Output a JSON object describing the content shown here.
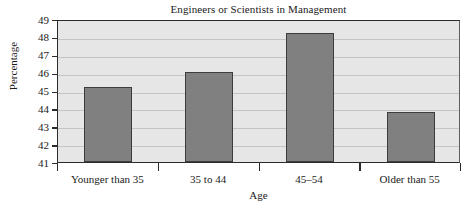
{
  "chart_data": {
    "type": "bar",
    "title": "Engineers or Scientists in Management",
    "xlabel": "Age",
    "ylabel": "Percentage",
    "categories": [
      "Younger than 35",
      "35 to 44",
      "45–54",
      "Older than 55"
    ],
    "values": [
      45.2,
      46.05,
      48.2,
      43.8
    ],
    "ylim": [
      41,
      49
    ],
    "yticks": [
      41,
      42,
      43,
      44,
      45,
      46,
      47,
      48,
      49
    ],
    "ytick_labels": [
      "41",
      "42",
      "43",
      "44",
      "45",
      "46",
      "47",
      "48",
      "49"
    ],
    "grid": true,
    "grid_axis": "y",
    "legend": false,
    "bar_color": "#808080",
    "bar_edge_color": "#3d3d3d",
    "plot_background": "#e6e6e6",
    "figure_background": "#ffffff",
    "gridline_color": "#c4c4c4",
    "axis_color": "#2b2b2b"
  }
}
